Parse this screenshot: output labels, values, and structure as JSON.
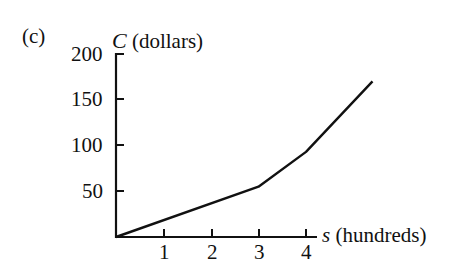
{
  "panel_label": "(c)",
  "chart_data": {
    "type": "line",
    "title": "",
    "xlabel_var": "s",
    "xlabel_unit": "(hundreds)",
    "ylabel_var": "C",
    "ylabel_unit": "(dollars)",
    "x_ticks": [
      "1",
      "2",
      "3",
      "4"
    ],
    "y_ticks": [
      "50",
      "100",
      "150",
      "200"
    ],
    "xlim": [
      0,
      5.6
    ],
    "ylim": [
      0,
      200
    ],
    "grid": false,
    "legend": null,
    "series": [
      {
        "name": "C(s)",
        "x": [
          0,
          3,
          4,
          5.4
        ],
        "y": [
          0,
          55,
          93,
          170
        ]
      }
    ]
  }
}
